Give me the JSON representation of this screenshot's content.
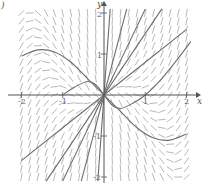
{
  "figure": {
    "panel_label": ")",
    "x_axis_label": "x",
    "y_axis_label": "y",
    "origin_label": "0",
    "x_ticks": [
      {
        "value": -2,
        "label": "-2"
      },
      {
        "value": -1,
        "label": "-1"
      },
      {
        "value": 1,
        "label": "1"
      },
      {
        "value": 2,
        "label": "2"
      }
    ],
    "y_ticks": [
      {
        "value": 2,
        "label": "2"
      },
      {
        "value": 1,
        "label": "1"
      },
      {
        "value": -1,
        "label": "-1"
      },
      {
        "value": -2,
        "label": "-2"
      }
    ],
    "xlim": [
      -2.2,
      2.2
    ],
    "ylim": [
      -2.2,
      2.2
    ],
    "colors": {
      "axis": "#555555",
      "field": "#9a9a9a",
      "curve": "#6e6e6e"
    },
    "slope_field": {
      "x_range": [
        -2,
        2
      ],
      "y_range": [
        -2,
        2
      ],
      "step": 0.2,
      "description": "direction field; steep near y-axis, near-horizontal in upper-left and lower-right quadrants"
    },
    "solution_curves": [
      {
        "name": "curve-upper-left-hump",
        "points": [
          [
            -2,
            0.95
          ],
          [
            -1.6,
            1.1
          ],
          [
            -1.2,
            1.05
          ],
          [
            -0.8,
            0.8
          ],
          [
            -0.4,
            0.4
          ],
          [
            -0.1,
            0.1
          ],
          [
            0,
            0
          ]
        ]
      },
      {
        "name": "curve-lower-right-hump",
        "points": [
          [
            0,
            0
          ],
          [
            0.1,
            -0.1
          ],
          [
            0.4,
            -0.4
          ],
          [
            0.8,
            -0.8
          ],
          [
            1.2,
            -1.05
          ],
          [
            1.6,
            -1.1
          ],
          [
            2,
            -0.95
          ]
        ]
      },
      {
        "name": "curve-small-s",
        "points": [
          [
            -1,
            0
          ],
          [
            -0.7,
            0.2
          ],
          [
            -0.4,
            0.33
          ],
          [
            -0.2,
            0.25
          ],
          [
            0,
            0
          ],
          [
            0.2,
            -0.25
          ],
          [
            0.4,
            -0.33
          ],
          [
            0.7,
            -0.2
          ],
          [
            1,
            0
          ],
          [
            1.4,
            0.4
          ],
          [
            1.8,
            0.9
          ],
          [
            2.1,
            1.3
          ]
        ]
      },
      {
        "name": "curve-line-1",
        "points": [
          [
            -2,
            -1.6
          ],
          [
            0,
            0
          ],
          [
            2,
            1.6
          ]
        ]
      },
      {
        "name": "curve-line-2",
        "points": [
          [
            -1.4,
            -2.1
          ],
          [
            0,
            0
          ],
          [
            1.4,
            2.1
          ]
        ]
      },
      {
        "name": "curve-line-3",
        "points": [
          [
            -1,
            -2.1
          ],
          [
            0,
            0
          ],
          [
            1,
            2.1
          ]
        ]
      },
      {
        "name": "curve-line-4",
        "points": [
          [
            -0.55,
            -2.1
          ],
          [
            0,
            0
          ],
          [
            0.55,
            2.1
          ]
        ]
      },
      {
        "name": "curve-line-5",
        "points": [
          [
            -0.15,
            -2.1
          ],
          [
            0,
            0
          ],
          [
            0.15,
            2.1
          ]
        ]
      }
    ]
  }
}
